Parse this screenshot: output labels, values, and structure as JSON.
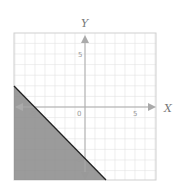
{
  "chart_data": {
    "type": "line",
    "title": "",
    "xlabel": "X",
    "ylabel": "Y",
    "xlim": [
      -7,
      7
    ],
    "ylim": [
      -7,
      7
    ],
    "grid": true,
    "tick_labels": {
      "x": [
        "-5",
        "0",
        "5"
      ],
      "y": [
        "5",
        "-5"
      ]
    },
    "series": [
      {
        "name": "boundary line y = -x - 5",
        "x": [
          -7,
          -5,
          0,
          2
        ],
        "y": [
          2,
          0,
          -5,
          -7
        ],
        "style": "solid"
      }
    ],
    "shaded_region": "below the line (y <= -x - 5)",
    "colors": {
      "shade": "#8a8a8a",
      "line": "#222222",
      "grid": "#dddddd",
      "axis": "#aaaaaa"
    }
  },
  "labels": {
    "x_axis": "X",
    "y_axis": "Y",
    "origin": "0",
    "x_pos5": "5",
    "x_neg5": "-5",
    "y_pos5": "5",
    "y_neg5": "-5"
  }
}
